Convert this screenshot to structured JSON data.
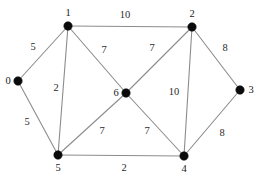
{
  "figure": {
    "type": "weighted-undirected-graph",
    "width": 262,
    "height": 177,
    "background_color": "#ffffff",
    "node_color": "#0b0b0b",
    "edge_color": "#8c8c8c",
    "label_color": "#1a1a1a"
  },
  "nodes": [
    {
      "id": "0",
      "label": "0",
      "x": 18,
      "y": 81,
      "label_x": 8,
      "label_y": 81
    },
    {
      "id": "1",
      "label": "1",
      "x": 68,
      "y": 26,
      "label_x": 68,
      "label_y": 13
    },
    {
      "id": "2",
      "label": "2",
      "x": 192,
      "y": 27,
      "label_x": 192,
      "label_y": 14
    },
    {
      "id": "3",
      "label": "3",
      "x": 240,
      "y": 90,
      "label_x": 251,
      "label_y": 90
    },
    {
      "id": "4",
      "label": "4",
      "x": 184,
      "y": 156,
      "label_x": 184,
      "label_y": 169
    },
    {
      "id": "5",
      "label": "5",
      "x": 58,
      "y": 155,
      "label_x": 58,
      "label_y": 168
    },
    {
      "id": "6",
      "label": "6",
      "x": 126,
      "y": 93,
      "label_x": 116,
      "label_y": 93
    }
  ],
  "edges": [
    {
      "source": "0",
      "target": "1",
      "weight": "5",
      "label_x": 33,
      "label_y": 47
    },
    {
      "source": "0",
      "target": "5",
      "weight": "5",
      "label_x": 27,
      "label_y": 122
    },
    {
      "source": "1",
      "target": "2",
      "weight": "10",
      "label_x": 125,
      "label_y": 15
    },
    {
      "source": "1",
      "target": "5",
      "weight": "2",
      "label_x": 56,
      "label_y": 88
    },
    {
      "source": "1",
      "target": "6",
      "weight": "7",
      "label_x": 104,
      "label_y": 50
    },
    {
      "source": "2",
      "target": "6",
      "weight": "7",
      "label_x": 152,
      "label_y": 48
    },
    {
      "source": "2",
      "target": "3",
      "weight": "8",
      "label_x": 225,
      "label_y": 48
    },
    {
      "source": "2",
      "target": "4",
      "weight": "10",
      "label_x": 174,
      "label_y": 92
    },
    {
      "source": "3",
      "target": "4",
      "weight": "8",
      "label_x": 222,
      "label_y": 133
    },
    {
      "source": "5",
      "target": "6",
      "weight": "7",
      "label_x": 102,
      "label_y": 131
    },
    {
      "source": "6",
      "target": "4",
      "weight": "7",
      "label_x": 147,
      "label_y": 131
    },
    {
      "source": "5",
      "target": "4",
      "weight": "2",
      "label_x": 124,
      "label_y": 168
    }
  ]
}
